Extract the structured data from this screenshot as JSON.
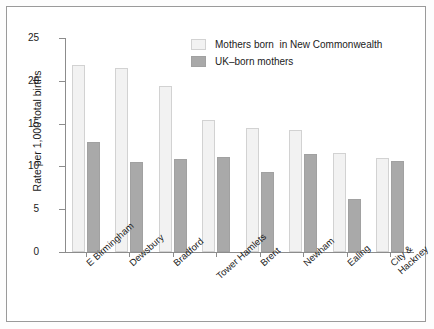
{
  "chart_data": {
    "type": "bar",
    "title": "",
    "subtitle": "",
    "xlabel": "",
    "ylabel": "Rate per 1,000 total births",
    "ylim": [
      0,
      25
    ],
    "yticks": [
      0,
      5,
      10,
      15,
      20,
      25
    ],
    "ytick_labels": [
      "0",
      "5",
      "10",
      "15",
      "20",
      "25"
    ],
    "grid": false,
    "legend_position": "top-right",
    "categories": [
      "E Birmingham",
      "Dewsbury",
      "Bradford",
      "Tower Hamlets",
      "Brent",
      "Newham",
      "Ealing",
      "City &\nHackney"
    ],
    "series": [
      {
        "name": "Mothers born  in New Commonwealth",
        "color": "#f2f2f2",
        "values": [
          21.9,
          21.5,
          19.4,
          15.4,
          14.5,
          14.2,
          11.6,
          11.0
        ]
      },
      {
        "name": "UK–born mothers",
        "color": "#a9a9a9",
        "values": [
          12.9,
          10.5,
          10.9,
          11.1,
          9.4,
          11.5,
          6.2,
          10.6
        ]
      }
    ]
  },
  "legend": {
    "items": [
      {
        "label": "Mothers born  in New Commonwealth",
        "swatch": "light"
      },
      {
        "label": "UK–born mothers",
        "swatch": "dark"
      }
    ]
  },
  "axes": {
    "y_title": "Rate per 1,000 total births"
  }
}
